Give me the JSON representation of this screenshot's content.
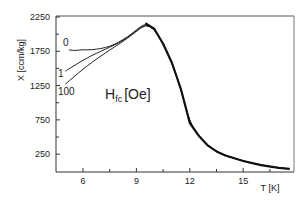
{
  "chart_data": {
    "type": "line",
    "title": "",
    "xlabel": "T [K]",
    "ylabel": "X [ccm/kg]",
    "xlim": [
      4.5,
      17.9
    ],
    "ylim": [
      0,
      2250
    ],
    "x_ticks": [
      6,
      9,
      12,
      15
    ],
    "y_ticks": [
      250,
      750,
      1250,
      1750,
      2250
    ],
    "grid": false,
    "annotation": {
      "main": "H",
      "sub": "fc",
      "unit": "[Oe]"
    },
    "series": [
      {
        "name": "0",
        "x": [
          5.2,
          5.6,
          6.0,
          6.5,
          7.0,
          7.5,
          8.0,
          8.5,
          9.0,
          9.5,
          10.0,
          10.5,
          11.0,
          11.5,
          12.0,
          12.5,
          13.0,
          13.5,
          14.0,
          15.0,
          16.0,
          17.0,
          17.6
        ],
        "y": [
          1770,
          1760,
          1775,
          1770,
          1790,
          1820,
          1880,
          1960,
          2060,
          2160,
          2080,
          1860,
          1580,
          1200,
          705,
          520,
          380,
          290,
          230,
          150,
          90,
          50,
          35
        ]
      },
      {
        "name": "1",
        "x": [
          5.0,
          5.5,
          6.0,
          6.5,
          7.0,
          7.5,
          8.0,
          8.5,
          9.0,
          9.5,
          10.0,
          10.5,
          11.0,
          11.5,
          12.0,
          12.5,
          13.0,
          13.5,
          14.0,
          15.0,
          16.0,
          17.0,
          17.6
        ],
        "y": [
          1460,
          1540,
          1620,
          1690,
          1750,
          1810,
          1870,
          1950,
          2050,
          2150,
          2080,
          1860,
          1580,
          1200,
          705,
          520,
          380,
          290,
          230,
          150,
          90,
          50,
          35
        ]
      },
      {
        "name": "100",
        "x": [
          5.0,
          5.5,
          6.0,
          6.5,
          7.0,
          7.5,
          8.0,
          8.5,
          9.0,
          9.5,
          10.0,
          10.5,
          11.0,
          11.5,
          12.0,
          12.5,
          13.0,
          13.5,
          14.0,
          15.0,
          16.0,
          17.0,
          17.6
        ],
        "y": [
          1270,
          1380,
          1490,
          1590,
          1680,
          1770,
          1850,
          1940,
          2040,
          2140,
          2080,
          1860,
          1580,
          1200,
          705,
          520,
          380,
          290,
          230,
          150,
          90,
          50,
          35
        ]
      }
    ],
    "legend_position": "none (labels at curve starts)"
  }
}
